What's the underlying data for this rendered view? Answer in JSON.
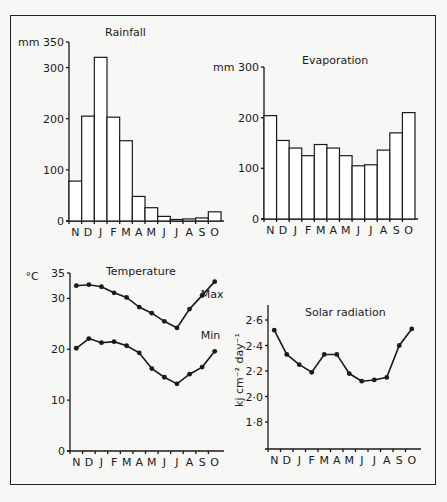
{
  "figure": {
    "months": [
      "N",
      "D",
      "J",
      "F",
      "M",
      "A",
      "M",
      "J",
      "J",
      "A",
      "S",
      "O"
    ]
  },
  "chart_data": [
    {
      "type": "bar",
      "title": "Rainfall",
      "ylabel": "mm",
      "categories": [
        "N",
        "D",
        "J",
        "F",
        "M",
        "A",
        "M",
        "J",
        "J",
        "A",
        "S",
        "O"
      ],
      "values": [
        78,
        205,
        320,
        203,
        157,
        48,
        26,
        9,
        3,
        4,
        6,
        18
      ],
      "yticks": [
        0,
        100,
        200,
        300,
        350
      ],
      "ytick_labels": [
        "0",
        "100",
        "200",
        "300",
        "mm 350"
      ],
      "ylim": [
        0,
        350
      ],
      "grid": false
    },
    {
      "type": "bar",
      "title": "Evaporation",
      "ylabel": "mm",
      "categories": [
        "N",
        "D",
        "J",
        "F",
        "M",
        "A",
        "M",
        "J",
        "J",
        "A",
        "S",
        "O"
      ],
      "values": [
        204,
        155,
        140,
        125,
        147,
        140,
        125,
        105,
        107,
        136,
        170,
        210
      ],
      "yticks": [
        0,
        100,
        200,
        300
      ],
      "ytick_labels": [
        "0",
        "100",
        "200",
        "mm 300"
      ],
      "ylim": [
        0,
        300
      ],
      "grid": false
    },
    {
      "type": "line",
      "title": "Temperature",
      "ylabel": "°C",
      "categories": [
        "N",
        "D",
        "J",
        "F",
        "M",
        "A",
        "M",
        "J",
        "J",
        "A",
        "S",
        "O"
      ],
      "series": [
        {
          "name": "Max",
          "values": [
            32.5,
            32.7,
            32.3,
            31.1,
            30.2,
            28.3,
            27.1,
            25.5,
            24.2,
            27.9,
            30.6,
            33.3
          ]
        },
        {
          "name": "Min",
          "values": [
            20.2,
            22.1,
            21.3,
            21.5,
            20.7,
            19.3,
            16.2,
            14.5,
            13.2,
            15.1,
            16.5,
            19.6
          ]
        }
      ],
      "yticks": [
        0,
        10,
        20,
        30,
        35
      ],
      "ytick_labels": [
        "0",
        "10",
        "20",
        "30",
        "35"
      ],
      "ylim": [
        0,
        35
      ],
      "grid": false
    },
    {
      "type": "line",
      "title": "Solar radiation",
      "ylabel": "kj cm-2 day-1",
      "categories": [
        "N",
        "D",
        "J",
        "F",
        "M",
        "A",
        "M",
        "J",
        "J",
        "A",
        "S",
        "O"
      ],
      "series": [
        {
          "name": "Solar radiation",
          "values": [
            2.52,
            2.33,
            2.25,
            2.19,
            2.33,
            2.33,
            2.18,
            2.12,
            2.13,
            2.15,
            2.4,
            2.53
          ]
        }
      ],
      "yticks": [
        1.8,
        2.0,
        2.2,
        2.4,
        2.6
      ],
      "ytick_labels": [
        "1·8",
        "2·0",
        "2·2",
        "2·4",
        "2·6"
      ],
      "ylim": [
        1.68,
        2.68
      ],
      "grid": false
    }
  ]
}
